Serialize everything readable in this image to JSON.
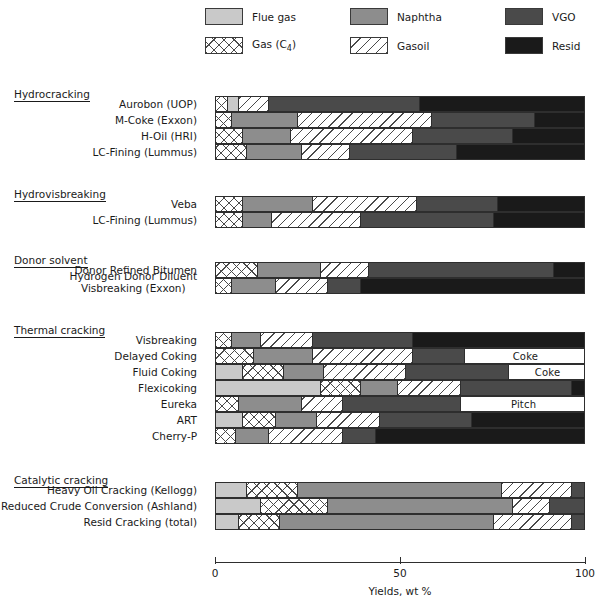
{
  "chart_data": {
    "type": "bar",
    "orientation": "horizontal",
    "stacked": true,
    "title": "",
    "xlabel": "Yields, wt %",
    "ylabel": "",
    "xlim": [
      0,
      100
    ],
    "xticks": [
      0,
      50,
      100
    ],
    "xtick_labels": [
      "0",
      "50",
      "100"
    ],
    "grid": false,
    "legend_position": "top",
    "legend": [
      {
        "key": "flue_gas",
        "label": "Flue gas",
        "color": "#c9c9c9",
        "pattern": "solid"
      },
      {
        "key": "gas_c4",
        "label": "Gas (C4)",
        "color": "#ffffff",
        "pattern": "crosshatch"
      },
      {
        "key": "naphtha",
        "label": "Naphtha",
        "color": "#8d8d8d",
        "pattern": "solid"
      },
      {
        "key": "gasoil",
        "label": "Gasoil",
        "color": "#ffffff",
        "pattern": "diagonal"
      },
      {
        "key": "vgo",
        "label": "VGO",
        "color": "#4a4a4a",
        "pattern": "solid"
      },
      {
        "key": "resid",
        "label": "Resid",
        "color": "#1a1a1a",
        "pattern": "solid"
      }
    ],
    "groups": [
      {
        "name": "Hydrocracking",
        "rows": [
          {
            "label": "Aurobon (UOP)",
            "segments": [
              {
                "key": "gas_c4",
                "value": 3
              },
              {
                "key": "flue_gas",
                "value": 3
              },
              {
                "key": "gasoil",
                "value": 8
              },
              {
                "key": "vgo",
                "value": 41
              },
              {
                "key": "resid",
                "value": 45
              }
            ]
          },
          {
            "label": "M-Coke (Exxon)",
            "segments": [
              {
                "key": "gas_c4",
                "value": 4
              },
              {
                "key": "naphtha",
                "value": 18
              },
              {
                "key": "gasoil",
                "value": 36
              },
              {
                "key": "vgo",
                "value": 28
              },
              {
                "key": "resid",
                "value": 14
              }
            ]
          },
          {
            "label": "H-Oil (HRI)",
            "segments": [
              {
                "key": "gas_c4",
                "value": 7
              },
              {
                "key": "naphtha",
                "value": 13
              },
              {
                "key": "gasoil",
                "value": 33
              },
              {
                "key": "vgo",
                "value": 27
              },
              {
                "key": "resid",
                "value": 20
              }
            ]
          },
          {
            "label": "LC-Fining (Lummus)",
            "segments": [
              {
                "key": "gas_c4",
                "value": 8
              },
              {
                "key": "naphtha",
                "value": 15
              },
              {
                "key": "gasoil",
                "value": 13
              },
              {
                "key": "vgo",
                "value": 29
              },
              {
                "key": "resid",
                "value": 35
              }
            ]
          }
        ]
      },
      {
        "name": "Hydrovisbreaking",
        "rows": [
          {
            "label": "Veba",
            "segments": [
              {
                "key": "gas_c4",
                "value": 7
              },
              {
                "key": "naphtha",
                "value": 19
              },
              {
                "key": "gasoil",
                "value": 28
              },
              {
                "key": "vgo",
                "value": 22
              },
              {
                "key": "resid",
                "value": 24
              }
            ]
          },
          {
            "label": "LC-Fining (Lummus)",
            "segments": [
              {
                "key": "gas_c4",
                "value": 7
              },
              {
                "key": "naphtha",
                "value": 8
              },
              {
                "key": "gasoil",
                "value": 24
              },
              {
                "key": "vgo",
                "value": 36
              },
              {
                "key": "resid",
                "value": 25
              }
            ]
          }
        ]
      },
      {
        "name": "Donor solvent",
        "rows": [
          {
            "label": "Donor Refined Bitumen",
            "segments": [
              {
                "key": "gas_c4",
                "value": 11
              },
              {
                "key": "naphtha",
                "value": 17
              },
              {
                "key": "gasoil",
                "value": 13
              },
              {
                "key": "vgo",
                "value": 50
              },
              {
                "key": "resid",
                "value": 9
              }
            ]
          },
          {
            "label": "Hydrogen Donor Diluent",
            "label_line2": "Visbreaking (Exxon)",
            "segments": [
              {
                "key": "gas_c4",
                "value": 4
              },
              {
                "key": "naphtha",
                "value": 12
              },
              {
                "key": "gasoil",
                "value": 14
              },
              {
                "key": "vgo",
                "value": 9
              },
              {
                "key": "resid",
                "value": 61
              }
            ]
          }
        ]
      },
      {
        "name": "Thermal cracking",
        "rows": [
          {
            "label": "Visbreaking",
            "segments": [
              {
                "key": "gas_c4",
                "value": 4
              },
              {
                "key": "naphtha",
                "value": 8
              },
              {
                "key": "gasoil",
                "value": 14
              },
              {
                "key": "vgo",
                "value": 27
              },
              {
                "key": "resid",
                "value": 47
              }
            ]
          },
          {
            "label": "Delayed Coking",
            "segments": [
              {
                "key": "gas_c4",
                "value": 10
              },
              {
                "key": "naphtha",
                "value": 16
              },
              {
                "key": "gasoil",
                "value": 27
              },
              {
                "key": "vgo",
                "value": 14
              },
              {
                "key": "coke",
                "value": 33,
                "text": "Coke"
              }
            ]
          },
          {
            "label": "Fluid Coking",
            "segments": [
              {
                "key": "flue_gas",
                "value": 7
              },
              {
                "key": "gas_c4",
                "value": 11
              },
              {
                "key": "naphtha",
                "value": 11
              },
              {
                "key": "gasoil",
                "value": 22
              },
              {
                "key": "vgo",
                "value": 28
              },
              {
                "key": "coke",
                "value": 21,
                "text": "Coke"
              }
            ]
          },
          {
            "label": "Flexicoking",
            "segments": [
              {
                "key": "flue_gas",
                "value": 28
              },
              {
                "key": "gas_c4",
                "value": 11
              },
              {
                "key": "naphtha",
                "value": 10
              },
              {
                "key": "gasoil",
                "value": 17
              },
              {
                "key": "vgo",
                "value": 30
              },
              {
                "key": "resid",
                "value": 4
              }
            ]
          },
          {
            "label": "Eureka",
            "segments": [
              {
                "key": "gas_c4",
                "value": 6
              },
              {
                "key": "naphtha",
                "value": 17
              },
              {
                "key": "gasoil",
                "value": 11
              },
              {
                "key": "vgo",
                "value": 32
              },
              {
                "key": "pitch",
                "value": 34,
                "text": "Pitch"
              }
            ]
          },
          {
            "label": "ART",
            "segments": [
              {
                "key": "flue_gas",
                "value": 7
              },
              {
                "key": "gas_c4",
                "value": 9
              },
              {
                "key": "naphtha",
                "value": 11
              },
              {
                "key": "gasoil",
                "value": 17
              },
              {
                "key": "vgo",
                "value": 25
              },
              {
                "key": "resid",
                "value": 31
              }
            ]
          },
          {
            "label": "Cherry-P",
            "segments": [
              {
                "key": "gas_c4",
                "value": 5
              },
              {
                "key": "naphtha",
                "value": 9
              },
              {
                "key": "gasoil",
                "value": 20
              },
              {
                "key": "vgo",
                "value": 9
              },
              {
                "key": "resid",
                "value": 57
              }
            ]
          }
        ]
      },
      {
        "name": "Catalytic cracking",
        "rows": [
          {
            "label": "Heavy Oil Cracking (Kellogg)",
            "segments": [
              {
                "key": "flue_gas",
                "value": 8
              },
              {
                "key": "gas_c4",
                "value": 14
              },
              {
                "key": "naphtha",
                "value": 55
              },
              {
                "key": "gasoil",
                "value": 19
              },
              {
                "key": "vgo",
                "value": 4
              }
            ]
          },
          {
            "label": "Reduced Crude Conversion (Ashland)",
            "segments": [
              {
                "key": "flue_gas",
                "value": 12
              },
              {
                "key": "gas_c4",
                "value": 18
              },
              {
                "key": "naphtha",
                "value": 50
              },
              {
                "key": "gasoil",
                "value": 10
              },
              {
                "key": "vgo",
                "value": 10
              }
            ]
          },
          {
            "label": "Resid Cracking (total)",
            "segments": [
              {
                "key": "flue_gas",
                "value": 6
              },
              {
                "key": "gas_c4",
                "value": 11
              },
              {
                "key": "naphtha",
                "value": 58
              },
              {
                "key": "gasoil",
                "value": 21
              },
              {
                "key": "vgo",
                "value": 4
              }
            ]
          }
        ]
      }
    ]
  },
  "axis": {
    "title": "Yields, wt %",
    "ticks": [
      {
        "value": 0,
        "label": "0"
      },
      {
        "value": 50,
        "label": "50"
      },
      {
        "value": 100,
        "label": "100"
      }
    ]
  }
}
